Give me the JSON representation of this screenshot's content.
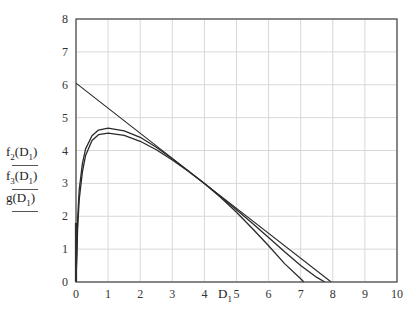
{
  "chart_data": {
    "type": "line",
    "title": "",
    "xlabel": "D",
    "xlabel_sub": "1",
    "ylabel_entries": [
      {
        "func": "f",
        "sub": "2",
        "arg": "D",
        "arg_sub": "1"
      },
      {
        "func": "f",
        "sub": "3",
        "arg": "D",
        "arg_sub": "1"
      },
      {
        "func": "g",
        "sub": "",
        "arg": "D",
        "arg_sub": "1"
      }
    ],
    "xlim": [
      0,
      10
    ],
    "ylim": [
      0,
      8
    ],
    "xticks": [
      "0",
      "1",
      "2",
      "3",
      "4",
      "5",
      "6",
      "7",
      "8",
      "9",
      "10"
    ],
    "yticks": [
      "0",
      "1",
      "2",
      "3",
      "4",
      "5",
      "6",
      "7",
      "8"
    ],
    "grid": true,
    "series": [
      {
        "name": "f2(D1)",
        "x": [
          0,
          0.05,
          0.1,
          0.2,
          0.3,
          0.5,
          0.7,
          1.0,
          1.5,
          2.0,
          2.5,
          3.0,
          3.5,
          4.0,
          4.5,
          5.0,
          5.5,
          6.0,
          6.5,
          7.0,
          7.1
        ],
        "y": [
          0,
          1.9,
          2.8,
          3.6,
          4.05,
          4.45,
          4.62,
          4.68,
          4.6,
          4.4,
          4.1,
          3.75,
          3.38,
          3.0,
          2.58,
          2.12,
          1.62,
          1.1,
          0.56,
          0.1,
          0
        ]
      },
      {
        "name": "f3(D1)",
        "x": [
          0,
          4,
          7.95
        ],
        "y": [
          6.05,
          3.0,
          0
        ]
      },
      {
        "name": "g(D1)",
        "x": [
          0,
          0.05,
          0.1,
          0.2,
          0.3,
          0.5,
          0.7,
          1.0,
          1.5,
          2.0,
          2.5,
          3.0,
          3.5,
          4.0,
          4.5,
          5.0,
          5.5,
          6.0,
          6.5,
          7.0,
          7.5,
          7.75
        ],
        "y": [
          0,
          1.6,
          2.5,
          3.35,
          3.85,
          4.3,
          4.48,
          4.53,
          4.46,
          4.28,
          4.02,
          3.71,
          3.37,
          3.0,
          2.6,
          2.2,
          1.78,
          1.35,
          0.92,
          0.5,
          0.14,
          0
        ]
      }
    ]
  },
  "footer": {
    "clipped_text_visible": false
  }
}
